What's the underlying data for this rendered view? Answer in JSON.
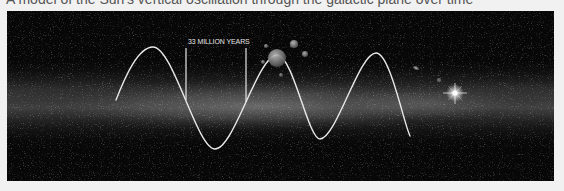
{
  "caption": {
    "text": "A model of the Sun's vertical oscillation through the galactic plane over time"
  },
  "figure": {
    "period_label": "33 MILLION YEARS",
    "colors": {
      "background": "#070707",
      "wave": "#e8e8e8",
      "galactic_band": "#9a9a9a",
      "page": "#f1f1f1"
    },
    "wave_points": [
      [
        109,
        89
      ],
      [
        146,
        36
      ],
      [
        208,
        138
      ],
      [
        270,
        44
      ],
      [
        313,
        128
      ],
      [
        369,
        42
      ],
      [
        403,
        125
      ]
    ],
    "bracket": {
      "left_x": 179,
      "right_x": 239,
      "top_y": 37,
      "left_bottom_y": 89,
      "right_bottom_y": 91
    },
    "sun_marker": {
      "cx": 270,
      "cy": 47,
      "r": 9
    },
    "moons": [
      {
        "cx": 287,
        "cy": 33,
        "r": 4
      },
      {
        "cx": 298,
        "cy": 43,
        "r": 3
      },
      {
        "cx": 259,
        "cy": 35,
        "r": 2
      },
      {
        "cx": 256,
        "cy": 51,
        "r": 2
      },
      {
        "cx": 274,
        "cy": 64,
        "r": 2
      }
    ],
    "bright_star": {
      "cx": 448,
      "cy": 82
    },
    "galaxy_blob": {
      "cx": 409,
      "cy": 57
    }
  }
}
